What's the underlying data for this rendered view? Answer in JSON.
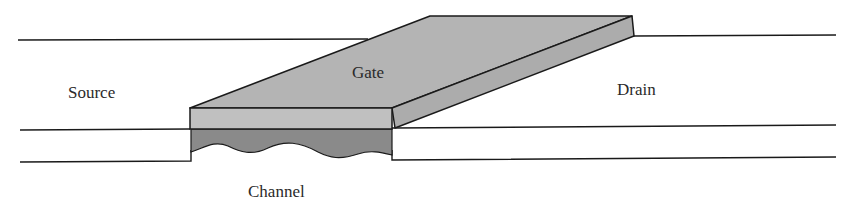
{
  "diagram": {
    "labels": {
      "source": "Source",
      "gate": "Gate",
      "drain": "Drain",
      "channel": "Channel"
    },
    "colors": {
      "line": "#1a1a1a",
      "gate_top": "#b4b4b4",
      "gate_front": "#c0c0c0",
      "gate_side": "#acacac",
      "channel": "#8a8a8a",
      "background": "#ffffff"
    }
  }
}
